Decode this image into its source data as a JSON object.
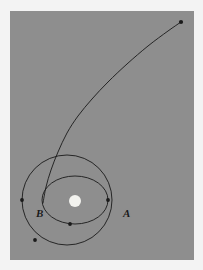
{
  "figure": {
    "background_color": "#8e8e8e",
    "border_color": "#f3f3f3",
    "stroke_color": "#1a1a1a",
    "central_body_color": "#f2f2ee"
  },
  "labels": {
    "point_a": "A",
    "point_b": "B"
  },
  "chart_data": {
    "type": "diagram",
    "xlabel": "",
    "ylabel": "",
    "units": "pixels in panel coordinates",
    "central_body": {
      "name": "central-body",
      "cx": 65,
      "cy": 190,
      "rx": 6,
      "ry": 6,
      "fill": "#f2f2ee"
    },
    "curves": [
      {
        "name": "circular-orbit",
        "kind": "circle",
        "cx": 57,
        "cy": 189,
        "rx": 45,
        "ry": 45,
        "rotation_deg": 0,
        "stroke": "#1a1a1a",
        "stroke_width": 0.9
      },
      {
        "name": "elliptical-transfer-orbit",
        "kind": "ellipse",
        "cx": 65,
        "cy": 189,
        "rx": 33,
        "ry": 24,
        "rotation_deg": 0,
        "stroke": "#1a1a1a",
        "stroke_width": 0.9
      },
      {
        "name": "escape-trajectory",
        "kind": "open-curve",
        "stroke": "#1a1a1a",
        "stroke_width": 0.9,
        "path_points": [
          [
            33,
            192
          ],
          [
            36,
            176
          ],
          [
            41,
            159
          ],
          [
            48,
            141
          ],
          [
            57,
            122
          ],
          [
            68,
            105
          ],
          [
            82,
            88
          ],
          [
            98,
            71
          ],
          [
            117,
            53
          ],
          [
            138,
            35
          ],
          [
            158,
            20
          ],
          [
            171,
            11
          ]
        ]
      }
    ],
    "markers": [
      {
        "name": "point-b-marker",
        "label": "B",
        "x": 12,
        "y": 189,
        "r": 1.9,
        "label_dx": -10,
        "label_dy": 3
      },
      {
        "name": "point-a-marker",
        "label": "A",
        "x": 98,
        "y": 189,
        "r": 1.9,
        "label_dx": 8,
        "label_dy": 3
      },
      {
        "name": "transfer-orbit-marker",
        "label": "",
        "x": 60,
        "y": 213,
        "r": 1.9,
        "label_dx": 0,
        "label_dy": 0
      },
      {
        "name": "circular-orbit-marker",
        "label": "",
        "x": 25,
        "y": 229,
        "r": 1.9,
        "label_dx": 0,
        "label_dy": 0
      },
      {
        "name": "escape-endpoint-marker",
        "label": "",
        "x": 171,
        "y": 11,
        "r": 2.1,
        "label_dx": 0,
        "label_dy": 0
      }
    ],
    "annotations": [
      "A marks the apoapsis point on the right of the orbits",
      "B marks the periapsis point on the left of the circular orbit",
      "The open curve is an escape trajectory leaving toward upper right"
    ]
  }
}
